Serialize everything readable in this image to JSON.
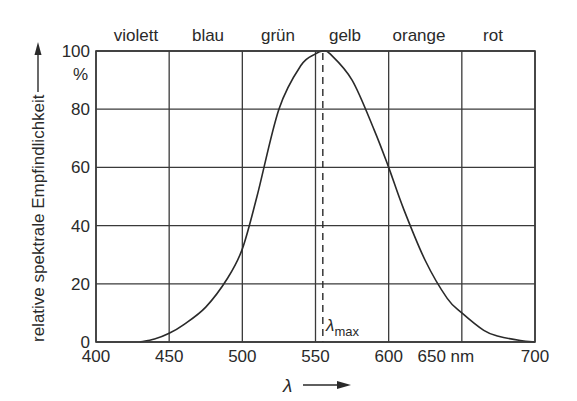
{
  "chart_data": {
    "type": "line",
    "title": "",
    "xlabel": "λ",
    "x_unit": "nm",
    "ylabel": "relative spektrale Empfindlichkeit",
    "y_unit": "%",
    "xlim": [
      400,
      700
    ],
    "ylim": [
      0,
      100
    ],
    "x_ticks": [
      400,
      450,
      500,
      550,
      600,
      650,
      700
    ],
    "x_tick_labels": [
      "400",
      "450",
      "500",
      "550",
      "600",
      "650 nm",
      "700"
    ],
    "y_ticks": [
      0,
      20,
      40,
      60,
      80,
      100
    ],
    "y_tick_labels": [
      "0",
      "20",
      "40",
      "60",
      "80",
      "100"
    ],
    "grid": true,
    "color_bands": [
      {
        "label": "violett",
        "center": 425
      },
      {
        "label": "blau",
        "center": 475
      },
      {
        "label": "grün",
        "center": 525
      },
      {
        "label": "gelb",
        "center": 570
      },
      {
        "label": "orange",
        "center": 620
      },
      {
        "label": "rot",
        "center": 675
      }
    ],
    "series": [
      {
        "name": "relative spektrale Empfindlichkeit",
        "x": [
          430,
          440,
          450,
          460,
          475,
          490,
          500,
          510,
          525,
          540,
          550,
          555,
          560,
          575,
          590,
          600,
          610,
          625,
          640,
          650,
          665,
          675,
          690,
          700
        ],
        "y": [
          0,
          1,
          3,
          6,
          12,
          22,
          32,
          50,
          80,
          95,
          99,
          100,
          99,
          90,
          73,
          60,
          46,
          28,
          15,
          10,
          4,
          2,
          0.5,
          0
        ]
      }
    ],
    "annotations": [
      {
        "type": "vline",
        "style": "dashed",
        "x": 555,
        "label": "λmax",
        "label_sub": "max"
      }
    ]
  },
  "labels": {
    "y_axis_title": "relative spektrale Empfindlichkeit",
    "y_unit": "%",
    "x_axis_symbol": "λ",
    "lambda_max_symbol": "λ",
    "lambda_max_sub": "max"
  }
}
